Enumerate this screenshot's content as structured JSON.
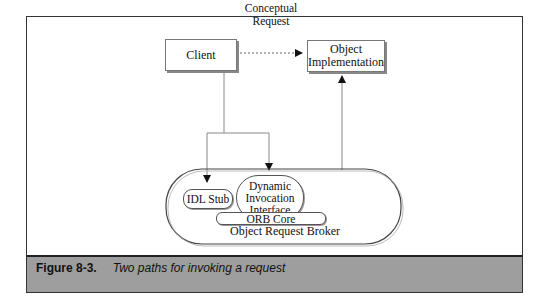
{
  "diagram": {
    "nodes": {
      "client": "Client",
      "object_impl_line1": "Object",
      "object_impl_line2": "Implementation",
      "idl_stub": "IDL Stub",
      "dii_line1": "Dynamic",
      "dii_line2": "Invocation",
      "dii_line3": "Interface",
      "orb_core": "ORB Core",
      "orb": "Object Request Broker"
    },
    "edges": {
      "conceptual_line1": "Conceptual",
      "conceptual_line2": "Request"
    }
  },
  "caption": {
    "number": "Figure 8-3.",
    "text": "Two paths for invoking a request"
  }
}
